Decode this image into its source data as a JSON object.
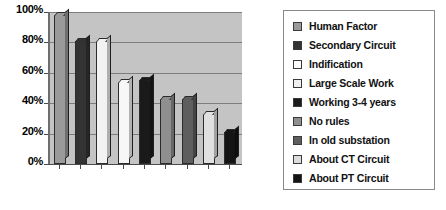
{
  "chart_data": {
    "type": "bar",
    "title": "",
    "subtitle": "",
    "xlabel": "",
    "ylabel": "",
    "ylim": [
      0,
      100
    ],
    "y_tick_labels": [
      "0%",
      "20%",
      "40%",
      "60%",
      "80%",
      "100%"
    ],
    "y_tick_values": [
      0,
      20,
      40,
      60,
      80,
      100
    ],
    "x_tick_labels": [],
    "grid": true,
    "legend_position": "right",
    "categories": [
      "Human Factor",
      "Secondary Circuit",
      "Indification",
      "Large Scale Work",
      "Working 3-4 years",
      "No rules",
      "In old substation",
      "About CT Circuit",
      "About PT Circuit"
    ],
    "values": [
      98,
      81,
      81,
      54,
      55,
      43,
      43,
      33,
      21
    ],
    "series": [
      {
        "name": "Percentage",
        "values": [
          98,
          81,
          81,
          54,
          55,
          43,
          43,
          33,
          21
        ]
      }
    ],
    "bar_colors": [
      "#9a9a9a",
      "#333333",
      "#f2f2f2",
      "#f7f7f7",
      "#1a1a1a",
      "#8f8f8f",
      "#5e5e5e",
      "#e0e0e0",
      "#141414"
    ],
    "plot_background": "#c4c4c4",
    "gridline_color": "#7d7d7d",
    "axis_color": "#4a4a4a"
  },
  "legend": {
    "items": [
      {
        "label": "Human Factor",
        "color": "#9a9a9a"
      },
      {
        "label": "Secondary Circuit",
        "color": "#333333"
      },
      {
        "label": "Indification",
        "color": "#fbfbfb"
      },
      {
        "label": "Large Scale Work",
        "color": "#f0f0f0"
      },
      {
        "label": "Working 3-4 years",
        "color": "#1a1a1a"
      },
      {
        "label": "No rules",
        "color": "#8f8f8f"
      },
      {
        "label": "In old substation",
        "color": "#5e5e5e"
      },
      {
        "label": "About CT Circuit",
        "color": "#dcdcdc"
      },
      {
        "label": "About PT Circuit",
        "color": "#141414"
      }
    ]
  }
}
